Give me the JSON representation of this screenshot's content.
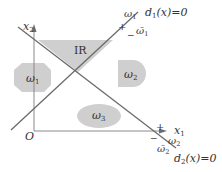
{
  "diagram": {
    "colors": {
      "background": "#ffffff",
      "line": "#6b6b6b",
      "axis": "#8a8a8a",
      "region_fill": "#cfcfcf",
      "text": "#333333"
    },
    "axes": {
      "x_label": "x",
      "x_sub": "1",
      "y_label": "x",
      "y_sub": "2",
      "origin_label": "O"
    },
    "regions": {
      "ir_label": "IR",
      "omega1_label": "ω",
      "omega1_sub": "1",
      "omega2_label": "ω",
      "omega2_sub": "2",
      "omega3_label": "ω",
      "omega3_sub": "3"
    },
    "boundaries": {
      "d1": {
        "equation_prefix": "d",
        "equation_sub": "1",
        "equation_suffix": "(x)=0",
        "positive_sign": "+",
        "negative_sign": "−",
        "positive_class": "ω",
        "positive_class_sub": "1",
        "negative_class": "ω̄",
        "negative_class_sub": "1"
      },
      "d2": {
        "equation_prefix": "d",
        "equation_sub": "2",
        "equation_suffix": "(x)=0",
        "positive_sign": "+",
        "negative_sign": "−",
        "positive_class": "ω",
        "positive_class_sub": "2",
        "negative_class": "ω̄",
        "negative_class_sub": "2"
      }
    }
  }
}
